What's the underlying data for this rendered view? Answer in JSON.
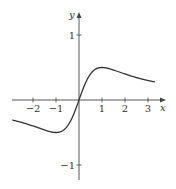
{
  "chart_data": {
    "type": "line",
    "title": "",
    "xlabel": "x",
    "ylabel": "y",
    "xlim": [
      -2.9,
      3.6
    ],
    "ylim": [
      -1.3,
      1.5
    ],
    "grid": false,
    "x_ticks": [
      -2,
      -1,
      1,
      2,
      3
    ],
    "x_tick_labels": [
      "−2",
      "−1",
      "1",
      "2",
      "3"
    ],
    "y_ticks": [
      1,
      -1
    ],
    "y_tick_labels": [
      "1",
      "−1"
    ],
    "series": [
      {
        "name": "f(x) = x/(x²+1)",
        "x": [
          -2.9,
          -2.5,
          -2,
          -1.5,
          -1,
          -0.5,
          0,
          0.5,
          1,
          1.5,
          2,
          2.5,
          3,
          3.3
        ],
        "y": [
          -0.31,
          -0.34,
          -0.4,
          -0.46,
          -0.5,
          -0.4,
          0,
          0.4,
          0.5,
          0.46,
          0.4,
          0.34,
          0.3,
          0.28
        ]
      }
    ],
    "annotations": [
      "local max at (1, 0.5)",
      "local min at (-1, -0.5)"
    ]
  },
  "axes": {
    "x_label": "x",
    "y_label": "y"
  }
}
